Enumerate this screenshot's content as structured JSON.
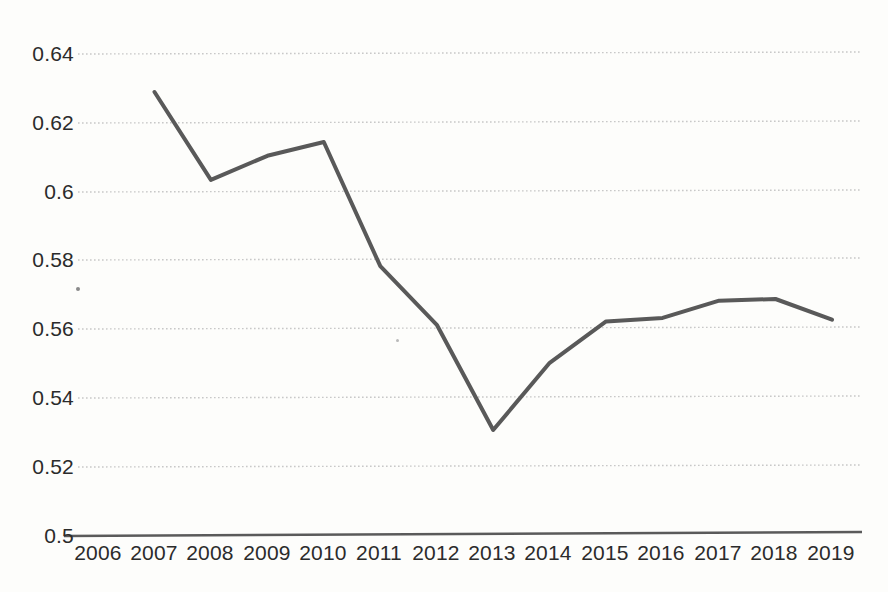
{
  "chart_data": {
    "type": "line",
    "title": "",
    "subtitle": "",
    "xlabel": "",
    "ylabel": "",
    "x": [
      2006,
      2007,
      2008,
      2009,
      2010,
      2011,
      2012,
      2013,
      2014,
      2015,
      2016,
      2017,
      2018,
      2019
    ],
    "categories": [
      "2006",
      "2007",
      "2008",
      "2009",
      "2010",
      "2011",
      "2012",
      "2013",
      "2014",
      "2015",
      "2016",
      "2017",
      "2018",
      "2019"
    ],
    "values": [
      null,
      0.629,
      0.6035,
      0.6105,
      0.6145,
      0.5785,
      0.5615,
      0.531,
      0.5505,
      0.5625,
      0.5635,
      0.5685,
      0.569,
      0.563
    ],
    "series": [
      {
        "name": "series-1",
        "values": [
          null,
          0.629,
          0.6035,
          0.6105,
          0.6145,
          0.5785,
          0.5615,
          0.531,
          0.5505,
          0.5625,
          0.5635,
          0.5685,
          0.569,
          0.563
        ]
      }
    ],
    "ylim": [
      0.5,
      0.645
    ],
    "xlim": [
      2006,
      2019
    ],
    "yticks": [
      0.5,
      0.52,
      0.54,
      0.56,
      0.58,
      0.6,
      0.62,
      0.64
    ],
    "ytick_labels": [
      "0.5",
      "0.52",
      "0.54",
      "0.56",
      "0.58",
      "0.6",
      "0.62",
      "0.64"
    ],
    "xtick_labels": [
      "2006",
      "2007",
      "2008",
      "2009",
      "2010",
      "2011",
      "2012",
      "2013",
      "2014",
      "2015",
      "2016",
      "2017",
      "2018",
      "2019"
    ],
    "grid": "horizontal-dotted",
    "legend": "none",
    "line_color": "#595959",
    "grid_color": "#c8c8c8",
    "axis_color": "#5a5a5a",
    "background_color": "#fdfdfb",
    "line_width": 4
  }
}
